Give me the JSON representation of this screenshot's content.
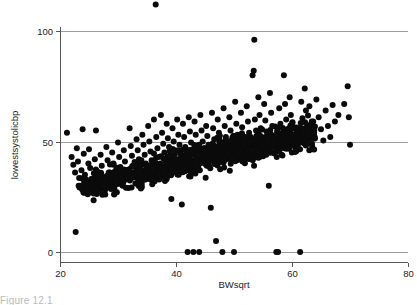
{
  "figure": {
    "name": "scatterplot-figure",
    "background": "#ffffff",
    "marker_color": "#0b0b0b",
    "grid_color": "#9a9c9e",
    "axis_color": "#555759"
  },
  "caption": {
    "partial_text": "Figure 12.1"
  },
  "chart_data": {
    "type": "scatter",
    "title": "",
    "subtitle": "",
    "xlabel": "BWsqrt",
    "ylabel": "lowestsystolicbp",
    "xlim": [
      20,
      80
    ],
    "ylim": [
      0,
      112
    ],
    "xticks": [
      20,
      40,
      60,
      80
    ],
    "yticks": [
      0,
      50,
      100
    ],
    "xtick_labels": [
      "20",
      "40",
      "60",
      "80"
    ],
    "ytick_labels": [
      "0",
      "50",
      "100"
    ],
    "grid": "horizontal",
    "gridlines_y": [
      0,
      50,
      100
    ],
    "legend": "none",
    "legend_position": "none",
    "marker_size": 3.0,
    "n_points_visible": 1180,
    "annotations": [],
    "clusters": [
      {
        "name": "main-cloud",
        "x_range": [
          21,
          70
        ],
        "y_range": [
          18,
          78
        ],
        "description": "rising dense band, core solid black between x 33-58 and y 38-55"
      },
      {
        "name": "zero-band",
        "x_range": [
          42,
          61.5
        ],
        "y_range": [
          0,
          0
        ],
        "description": "isolated points coded at zero"
      },
      {
        "name": "high-outlier",
        "x_range": [
          36.5,
          36.5
        ],
        "y_range": [
          112,
          112
        ],
        "description": "single point above the 100 gridline"
      },
      {
        "name": "low-outlier",
        "x_range": [
          22.7,
          22.7
        ],
        "y_range": [
          9,
          9
        ],
        "description": "single low point near left edge"
      }
    ],
    "points": [
      [
        21.2,
        54.0
      ],
      [
        22.0,
        43.0
      ],
      [
        22.3,
        39.5
      ],
      [
        22.6,
        36.0
      ],
      [
        22.7,
        9.0
      ],
      [
        22.9,
        47.0
      ],
      [
        23.1,
        41.0
      ],
      [
        23.3,
        33.5
      ],
      [
        23.5,
        30.0
      ],
      [
        23.7,
        37.0
      ],
      [
        23.9,
        55.5
      ],
      [
        24.1,
        44.5
      ],
      [
        24.3,
        35.0
      ],
      [
        24.5,
        31.0
      ],
      [
        24.7,
        28.0
      ],
      [
        24.9,
        40.0
      ],
      [
        25.0,
        46.5
      ],
      [
        25.2,
        38.0
      ],
      [
        25.4,
        33.0
      ],
      [
        25.6,
        29.5
      ],
      [
        25.8,
        26.5
      ],
      [
        26.0,
        42.0
      ],
      [
        26.2,
        55.0
      ],
      [
        26.4,
        36.5
      ],
      [
        26.6,
        31.5
      ],
      [
        26.8,
        27.5
      ],
      [
        27.0,
        44.0
      ],
      [
        27.2,
        39.0
      ],
      [
        27.4,
        34.0
      ],
      [
        27.6,
        30.0
      ],
      [
        27.8,
        26.0
      ],
      [
        28.0,
        47.5
      ],
      [
        28.2,
        41.5
      ],
      [
        28.4,
        36.0
      ],
      [
        28.6,
        32.0
      ],
      [
        28.8,
        28.5
      ],
      [
        29.0,
        45.0
      ],
      [
        29.2,
        40.0
      ],
      [
        29.4,
        35.5
      ],
      [
        29.6,
        31.0
      ],
      [
        29.8,
        27.0
      ],
      [
        30.0,
        49.5
      ],
      [
        30.2,
        43.0
      ],
      [
        30.4,
        38.5
      ],
      [
        30.6,
        34.0
      ],
      [
        30.8,
        30.0
      ],
      [
        31.0,
        46.0
      ],
      [
        31.2,
        41.0
      ],
      [
        31.4,
        37.0
      ],
      [
        31.6,
        33.0
      ],
      [
        31.8,
        29.0
      ],
      [
        32.0,
        56.0
      ],
      [
        32.2,
        48.0
      ],
      [
        32.4,
        43.5
      ],
      [
        32.6,
        39.0
      ],
      [
        32.8,
        35.0
      ],
      [
        33.0,
        31.0
      ],
      [
        33.2,
        51.0
      ],
      [
        33.4,
        46.0
      ],
      [
        33.6,
        42.0
      ],
      [
        33.8,
        38.0
      ],
      [
        34.0,
        34.0
      ],
      [
        34.2,
        53.0
      ],
      [
        34.4,
        48.5
      ],
      [
        34.6,
        44.0
      ],
      [
        34.8,
        40.0
      ],
      [
        35.0,
        36.0
      ],
      [
        35.2,
        57.0
      ],
      [
        35.4,
        50.0
      ],
      [
        35.6,
        45.5
      ],
      [
        35.8,
        41.5
      ],
      [
        36.0,
        37.5
      ],
      [
        36.2,
        60.0
      ],
      [
        36.5,
        112.0
      ],
      [
        36.6,
        52.0
      ],
      [
        36.8,
        47.0
      ],
      [
        37.0,
        43.0
      ],
      [
        37.2,
        39.0
      ],
      [
        37.4,
        62.0
      ],
      [
        37.6,
        54.0
      ],
      [
        37.8,
        49.0
      ],
      [
        38.0,
        45.0
      ],
      [
        38.2,
        41.0
      ],
      [
        38.4,
        58.0
      ],
      [
        38.6,
        51.5
      ],
      [
        38.8,
        47.5
      ],
      [
        39.0,
        43.5
      ],
      [
        39.2,
        24.0
      ],
      [
        39.4,
        56.0
      ],
      [
        39.6,
        50.0
      ],
      [
        39.8,
        46.0
      ],
      [
        40.0,
        42.0
      ],
      [
        40.2,
        60.0
      ],
      [
        40.4,
        53.0
      ],
      [
        40.6,
        48.5
      ],
      [
        40.8,
        44.5
      ],
      [
        41.0,
        21.5
      ],
      [
        41.2,
        58.0
      ],
      [
        41.4,
        52.0
      ],
      [
        41.6,
        47.5
      ],
      [
        41.8,
        43.5
      ],
      [
        42.0,
        0.0
      ],
      [
        42.2,
        61.0
      ],
      [
        42.4,
        54.5
      ],
      [
        42.6,
        49.5
      ],
      [
        42.8,
        45.5
      ],
      [
        43.0,
        0.0
      ],
      [
        43.2,
        59.0
      ],
      [
        43.4,
        53.0
      ],
      [
        43.6,
        48.0
      ],
      [
        43.8,
        44.0
      ],
      [
        44.0,
        0.0
      ],
      [
        44.2,
        62.0
      ],
      [
        44.4,
        55.0
      ],
      [
        44.6,
        50.0
      ],
      [
        44.8,
        46.0
      ],
      [
        45.0,
        41.0
      ],
      [
        45.2,
        57.0
      ],
      [
        45.4,
        52.5
      ],
      [
        45.6,
        48.5
      ],
      [
        45.8,
        44.5
      ],
      [
        46.0,
        20.0
      ],
      [
        46.2,
        63.0
      ],
      [
        46.4,
        56.0
      ],
      [
        46.6,
        51.0
      ],
      [
        46.8,
        47.0
      ],
      [
        46.9,
        5.0
      ],
      [
        47.0,
        43.0
      ],
      [
        47.2,
        60.0
      ],
      [
        47.4,
        54.0
      ],
      [
        47.6,
        49.5
      ],
      [
        47.8,
        45.5
      ],
      [
        48.0,
        0.0
      ],
      [
        48.2,
        65.0
      ],
      [
        48.4,
        57.0
      ],
      [
        48.6,
        52.0
      ],
      [
        48.8,
        48.0
      ],
      [
        49.0,
        44.0
      ],
      [
        49.2,
        61.0
      ],
      [
        49.4,
        55.0
      ],
      [
        49.6,
        50.5
      ],
      [
        49.8,
        46.5
      ],
      [
        50.0,
        0.0
      ],
      [
        50.2,
        68.0
      ],
      [
        50.4,
        58.0
      ],
      [
        50.6,
        53.0
      ],
      [
        50.8,
        49.0
      ],
      [
        51.0,
        45.0
      ],
      [
        51.2,
        63.0
      ],
      [
        51.4,
        56.5
      ],
      [
        51.6,
        51.5
      ],
      [
        51.8,
        47.5
      ],
      [
        52.0,
        43.0
      ],
      [
        52.2,
        66.0
      ],
      [
        52.4,
        59.0
      ],
      [
        52.6,
        54.0
      ],
      [
        52.8,
        50.0
      ],
      [
        53.0,
        46.0
      ],
      [
        53.2,
        80.0
      ],
      [
        53.4,
        82.0
      ],
      [
        53.5,
        96.0
      ],
      [
        53.6,
        60.0
      ],
      [
        53.8,
        55.0
      ],
      [
        54.0,
        51.0
      ],
      [
        54.2,
        70.0
      ],
      [
        54.4,
        62.0
      ],
      [
        54.6,
        56.0
      ],
      [
        54.8,
        52.0
      ],
      [
        55.0,
        48.0
      ],
      [
        55.2,
        67.0
      ],
      [
        55.4,
        59.5
      ],
      [
        55.6,
        54.5
      ],
      [
        55.8,
        50.5
      ],
      [
        56.0,
        30.0
      ],
      [
        56.2,
        72.0
      ],
      [
        56.4,
        63.0
      ],
      [
        56.6,
        57.0
      ],
      [
        56.8,
        52.5
      ],
      [
        57.0,
        48.5
      ],
      [
        57.3,
        0.0
      ],
      [
        57.6,
        0.0
      ],
      [
        57.8,
        65.0
      ],
      [
        58.0,
        58.0
      ],
      [
        58.2,
        53.0
      ],
      [
        58.4,
        49.0
      ],
      [
        58.6,
        80.0
      ],
      [
        58.8,
        67.0
      ],
      [
        59.0,
        60.0
      ],
      [
        59.2,
        55.0
      ],
      [
        59.4,
        50.0
      ],
      [
        59.6,
        70.0
      ],
      [
        59.8,
        62.0
      ],
      [
        60.0,
        56.0
      ],
      [
        60.2,
        51.0
      ],
      [
        61.4,
        0.0
      ],
      [
        61.6,
        68.0
      ],
      [
        61.8,
        60.5
      ],
      [
        62.0,
        55.0
      ],
      [
        62.2,
        74.0
      ],
      [
        62.4,
        64.0
      ],
      [
        62.6,
        57.5
      ],
      [
        62.8,
        52.5
      ],
      [
        63.0,
        66.0
      ],
      [
        63.4,
        59.0
      ],
      [
        63.8,
        54.0
      ],
      [
        64.2,
        69.0
      ],
      [
        64.6,
        61.0
      ],
      [
        65.0,
        55.5
      ],
      [
        65.4,
        50.5
      ],
      [
        65.8,
        64.0
      ],
      [
        66.2,
        57.0
      ],
      [
        66.6,
        52.0
      ],
      [
        67.0,
        66.5
      ],
      [
        67.4,
        59.0
      ],
      [
        68.0,
        62.0
      ],
      [
        69.0,
        67.0
      ],
      [
        69.6,
        75.0
      ],
      [
        69.8,
        61.0
      ],
      [
        70.0,
        48.5
      ]
    ]
  }
}
